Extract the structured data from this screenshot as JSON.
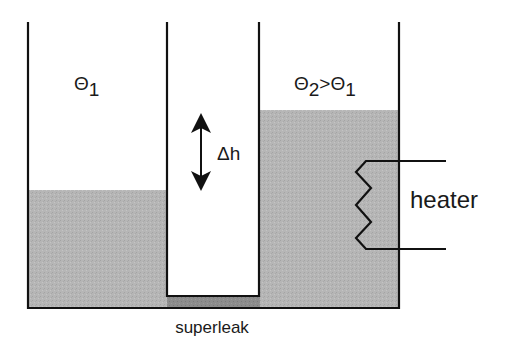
{
  "diagram": {
    "type": "fountain-effect / thermomechanical effect apparatus",
    "left_vessel": {
      "label_symbol": "Θ",
      "label_sub": "1"
    },
    "right_vessel": {
      "label_parts": [
        "Θ",
        "2",
        ">Θ",
        "1"
      ]
    },
    "height_difference": {
      "label": "Δh"
    },
    "superleak": {
      "label": "superleak"
    },
    "heater": {
      "label": "heater"
    },
    "colors": {
      "liquid": "#b4b4b4",
      "superleak": "#8a8a8a",
      "walls": "#111111",
      "background": "#ffffff"
    }
  }
}
